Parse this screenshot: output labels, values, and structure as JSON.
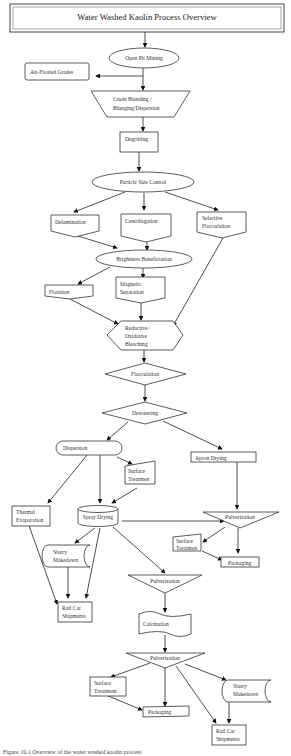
{
  "diagram": {
    "title": "Water Washed Kaolin Process Overview",
    "nodes": {
      "open_pit_mining": "Open Pit Mining",
      "air_floated_grades": "Air-Floated Grades",
      "crude_blending_1": "Crude Blending /",
      "crude_blending_2": "Blunging/Dispersion",
      "degritting": "Degritting",
      "particle_size_control": "Particle Size Control",
      "delamination": "Delamination",
      "centrifugation": "Centrifugation",
      "selective_flocculation_1": "Selective",
      "selective_flocculation_2": "Flocculation",
      "brightness_beneficiation": "Brightness Beneficiation",
      "flotation": "Flotation",
      "magnetic_separation_1": "Magnetic",
      "magnetic_separation_2": "Separation",
      "bleaching_1": "Reductive /",
      "bleaching_2": "Oxidative",
      "bleaching_3": "Bleaching",
      "flocculation": "Flocculation",
      "dewatering": "Dewatering",
      "dispersion": "Dispersion",
      "surface_treatment_a_1": "Surface",
      "surface_treatment_a_2": "Treatmen",
      "apron_drying": "Apron Drying",
      "thermal_evaporation_1": "Thermal",
      "thermal_evaporation_2": "Evaporation",
      "spray_drying": "Spray Drying",
      "pulverization_right": "Pulverization",
      "surface_treatment_b_1": "Surface",
      "surface_treatment_b_2": "Treatmen",
      "packaging_right": "Packaging",
      "slurry_makedown_left_1": "Slurry",
      "slurry_makedown_left_2": "Makedown",
      "pulverization_mid": "Pulverization",
      "rail_car_left_1": "Rail Car",
      "rail_car_left_2": "Shipments",
      "calcination": "Calcination",
      "pulverization_bottom": "Pulverization",
      "surface_treatment_c_1": "Surface",
      "surface_treatment_c_2": "Treatment",
      "packaging_bottom": "Packaging",
      "slurry_makedown_right_1": "Slurry",
      "slurry_makedown_right_2": "Makedown",
      "rail_car_right_1": "Rail Car",
      "rail_car_right_2": "Shipments"
    },
    "caption": "Figure 10.1 Overview of the water washed kaolin process"
  }
}
